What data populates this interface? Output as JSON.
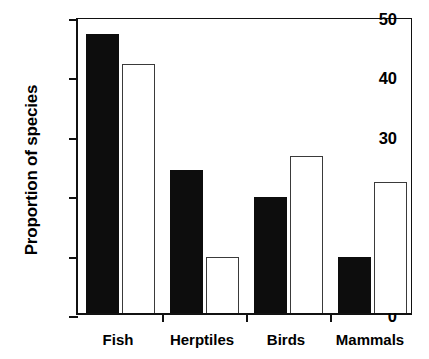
{
  "chart_data": {
    "type": "bar",
    "title": "",
    "subtitle": "",
    "xlabel": "",
    "ylabel": "Proportion of species",
    "categories": [
      "Fish",
      "Herptiles",
      "Birds",
      "Mammals"
    ],
    "series": [
      {
        "name": "filled",
        "style": "solid-black",
        "values": [
          47,
          24,
          19.5,
          9.4
        ]
      },
      {
        "name": "open",
        "style": "open-white",
        "values": [
          42,
          9.4,
          26.4,
          22
        ]
      }
    ],
    "ylim": [
      0,
      50
    ],
    "ytick_values": [
      0,
      10,
      20,
      30,
      40,
      50
    ],
    "ytick_labels": [
      "0",
      "10",
      "20",
      "30",
      "40",
      "50"
    ],
    "grid": false,
    "legend": "none",
    "colors": {
      "filled_bar": "#0d0d0d",
      "open_bar_fill": "#ffffff",
      "open_bar_edge": "#3a3a3a",
      "axis": "#111111",
      "background": "#ffffff"
    }
  }
}
